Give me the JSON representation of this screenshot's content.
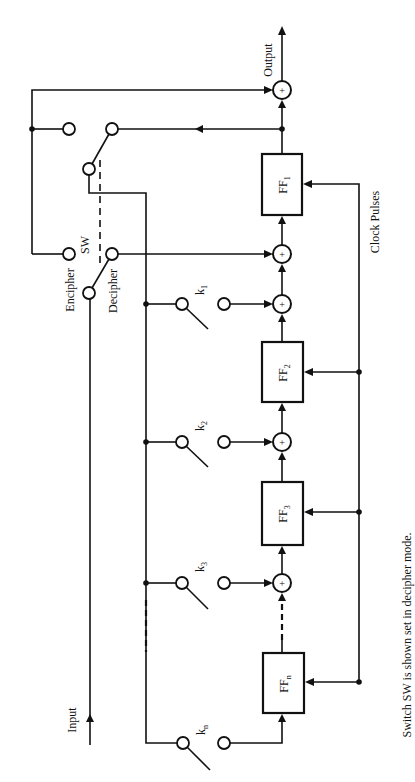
{
  "diagram": {
    "labels": {
      "output": "Output",
      "input": "Input",
      "clock": "Clock Pulses",
      "encipher": "Encipher",
      "decipher": "Decipher",
      "switch": "SW",
      "xor_symbol": "+"
    },
    "flip_flops": [
      {
        "name": "FF",
        "sub": "1"
      },
      {
        "name": "FF",
        "sub": "2"
      },
      {
        "name": "FF",
        "sub": "3"
      },
      {
        "name": "FF",
        "sub": "n"
      }
    ],
    "key_switches": [
      {
        "name": "k",
        "sub": "1"
      },
      {
        "name": "k",
        "sub": "2"
      },
      {
        "name": "k",
        "sub": "3"
      },
      {
        "name": "k",
        "sub": "n"
      }
    ],
    "footnote": "Switch SW is shown set in decipher mode."
  }
}
